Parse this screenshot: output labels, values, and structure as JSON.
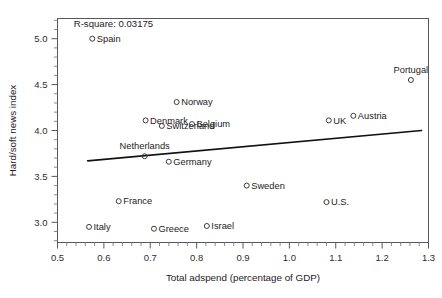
{
  "chart_data": {
    "type": "scatter",
    "title": "",
    "xlabel": "Total adspend (percentage of GDP)",
    "ylabel": "Hard/soft news index",
    "xlim": [
      0.5,
      1.3
    ],
    "ylim": [
      2.78,
      5.22
    ],
    "xticks": [
      "0.5",
      "0.6",
      "0.7",
      "0.8",
      "0.9",
      "1.0",
      "1.1",
      "1.2",
      "1.3"
    ],
    "xtick_values": [
      0.5,
      0.6,
      0.7,
      0.8,
      0.9,
      1.0,
      1.1,
      1.2,
      1.3
    ],
    "yticks": [
      "3.0",
      "3.5",
      "4.0",
      "4.5",
      "5.0"
    ],
    "ytick_values": [
      3.0,
      3.5,
      4.0,
      4.5,
      5.0
    ],
    "grid": false,
    "legend": null,
    "minor_ticks": true,
    "annotations": [
      {
        "text": "R-square: 0.03175",
        "x": 0.535,
        "y": 5.13
      }
    ],
    "trend_line": {
      "label": "linear fit",
      "x_start": 0.565,
      "y_start": 3.67,
      "x_end": 1.285,
      "y_end": 4.0
    },
    "points": [
      {
        "label": "Spain",
        "x": 0.575,
        "y": 5.0,
        "label_pos": "right"
      },
      {
        "label": "Portugal",
        "x": 1.262,
        "y": 4.55,
        "label_pos": "above"
      },
      {
        "label": "Norway",
        "x": 0.757,
        "y": 4.31,
        "label_pos": "right"
      },
      {
        "label": "Denmark",
        "x": 0.69,
        "y": 4.11,
        "label_pos": "right"
      },
      {
        "label": "UK",
        "x": 1.085,
        "y": 4.11,
        "label_pos": "right"
      },
      {
        "label": "Austria",
        "x": 1.138,
        "y": 4.16,
        "label_pos": "right"
      },
      {
        "label": "Belgium",
        "x": 0.79,
        "y": 4.07,
        "label_pos": "right"
      },
      {
        "label": "Switzerland",
        "x": 0.725,
        "y": 4.05,
        "label_pos": "right"
      },
      {
        "label": "Netherlands",
        "x": 0.688,
        "y": 3.72,
        "label_pos": "above"
      },
      {
        "label": "Germany",
        "x": 0.74,
        "y": 3.66,
        "label_pos": "right"
      },
      {
        "label": "Sweden",
        "x": 0.908,
        "y": 3.4,
        "label_pos": "right"
      },
      {
        "label": "U.S.",
        "x": 1.08,
        "y": 3.22,
        "label_pos": "right"
      },
      {
        "label": "France",
        "x": 0.632,
        "y": 3.23,
        "label_pos": "right"
      },
      {
        "label": "Italy",
        "x": 0.568,
        "y": 2.95,
        "label_pos": "right"
      },
      {
        "label": "Greece",
        "x": 0.708,
        "y": 2.93,
        "label_pos": "right"
      },
      {
        "label": "Israel",
        "x": 0.822,
        "y": 2.96,
        "label_pos": "right"
      }
    ]
  }
}
